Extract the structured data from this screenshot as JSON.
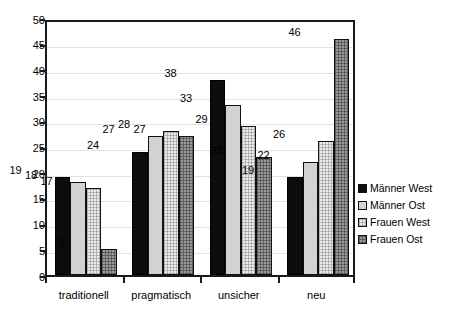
{
  "chart_data": {
    "type": "bar",
    "title": "",
    "subtitle": "",
    "xlabel": "",
    "ylabel": "",
    "categories": [
      "traditionell",
      "pragmatisch",
      "unsicher",
      "neu"
    ],
    "series": [
      {
        "name": "Männer West",
        "values": [
          19,
          24,
          38,
          19
        ],
        "color": "#0d0d0d",
        "pattern": "solid-black"
      },
      {
        "name": "Männer Ost",
        "values": [
          18,
          27,
          33,
          22
        ],
        "color": "#d2d2d2",
        "pattern": "solid-light-gray"
      },
      {
        "name": "Frauen West",
        "values": [
          17,
          28,
          29,
          26
        ],
        "color": "#ececec",
        "pattern": "fine-dotted"
      },
      {
        "name": "Frauen Ost",
        "values": [
          5,
          27,
          23,
          46
        ],
        "color": "#9a9a9a",
        "pattern": "checkered-gray"
      }
    ],
    "ylim": [
      0,
      50
    ],
    "ytick_step": 5,
    "yticks": [
      "0",
      "5",
      "10",
      "15",
      "20",
      "25",
      "30",
      "35",
      "40",
      "45",
      "50"
    ],
    "grid": true,
    "grid_axis": "y",
    "legend_position": "right",
    "show_value_labels": true,
    "background_color": "#ffffff",
    "axis_color": "#1a1a1a",
    "gridline_color": "#e3e3e3"
  }
}
